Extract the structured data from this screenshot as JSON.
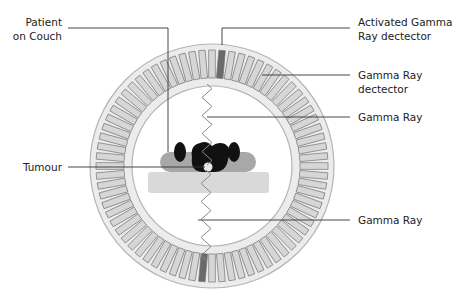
{
  "diagram": {
    "type": "PET scanner cross-section",
    "labels": {
      "patient": "Patient\non Couch",
      "activated_detector": "Activated Gamma\nRay dectector",
      "detector": "Gamma Ray\ndectector",
      "gamma_ray_top": "Gamma Ray",
      "tumour": "Tumour",
      "gamma_ray_bottom": "Gamma Ray"
    },
    "ring": {
      "center_x": 212,
      "center_y": 166,
      "outer_radius": 122,
      "inner_radius": 80,
      "detector_count": 72
    },
    "colors": {
      "ring_fill": "#ececec",
      "ring_stroke": "#b5b5b5",
      "detector_fill": "#d6d6d6",
      "detector_stroke": "#777777",
      "activated_detector": "#6a6a6a",
      "patient_body": "#111111",
      "patient_arms": "#a8a8a8",
      "couch": "#d9d9d9",
      "wave": "#888888",
      "leader_line": "#333333"
    }
  }
}
